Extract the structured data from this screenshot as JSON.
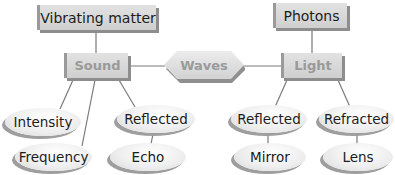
{
  "diagram": {
    "type": "concept-map",
    "center": {
      "label": "Waves",
      "shape": "hexagon"
    },
    "branches": {
      "sound": {
        "label": "Sound",
        "source": "Vibrating matter",
        "properties": [
          "Intensity",
          "Frequency",
          "Reflected"
        ],
        "reflected_example": "Echo"
      },
      "light": {
        "label": "Light",
        "source": "Photons",
        "behaviors": [
          "Reflected",
          "Refracted"
        ],
        "reflected_example": "Mirror",
        "refracted_example": "Lens"
      }
    },
    "nodes": {
      "vibrating_matter": "Vibrating matter",
      "photons": "Photons",
      "sound": "Sound",
      "waves": "Waves",
      "light": "Light",
      "intensity": "Intensity",
      "frequency": "Frequency",
      "sound_reflected": "Reflected",
      "echo": "Echo",
      "light_reflected": "Reflected",
      "refracted": "Refracted",
      "mirror": "Mirror",
      "lens": "Lens"
    },
    "edges": [
      [
        "Vibrating matter",
        "Sound"
      ],
      [
        "Sound",
        "Waves"
      ],
      [
        "Waves",
        "Light"
      ],
      [
        "Photons",
        "Light"
      ],
      [
        "Sound",
        "Intensity"
      ],
      [
        "Sound",
        "Frequency"
      ],
      [
        "Sound",
        "Reflected"
      ],
      [
        "Reflected",
        "Echo"
      ],
      [
        "Light",
        "Reflected"
      ],
      [
        "Light",
        "Refracted"
      ],
      [
        "Reflected",
        "Mirror"
      ],
      [
        "Refracted",
        "Lens"
      ]
    ],
    "colors": {
      "box_fill": "#d8d8d8",
      "box_shadow": "#8d8d8d",
      "category_text": "#9a9a9a",
      "text": "#1c1c1c",
      "line": "#7a7a7a"
    }
  }
}
